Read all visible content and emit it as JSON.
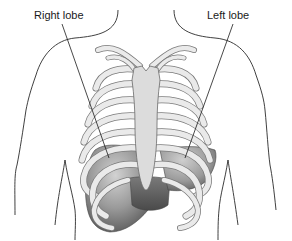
{
  "diagram": {
    "labels": {
      "right_lobe": "Right lobe",
      "left_lobe": "Left lobe"
    },
    "structures": [
      "body-outline",
      "clavicles",
      "ribs",
      "sternum",
      "liver-right-lobe",
      "liver-left-lobe"
    ],
    "colors": {
      "outline": "#2a2a2a",
      "rib_fill": "#e8e8e8",
      "rib_stroke": "#7a7a7a",
      "sternum_fill": "#dcdcdc",
      "liver_dark": "#5a5a5a",
      "liver_mid": "#8c8c8c",
      "liver_light": "#c4c4c4",
      "background": "#ffffff"
    }
  }
}
